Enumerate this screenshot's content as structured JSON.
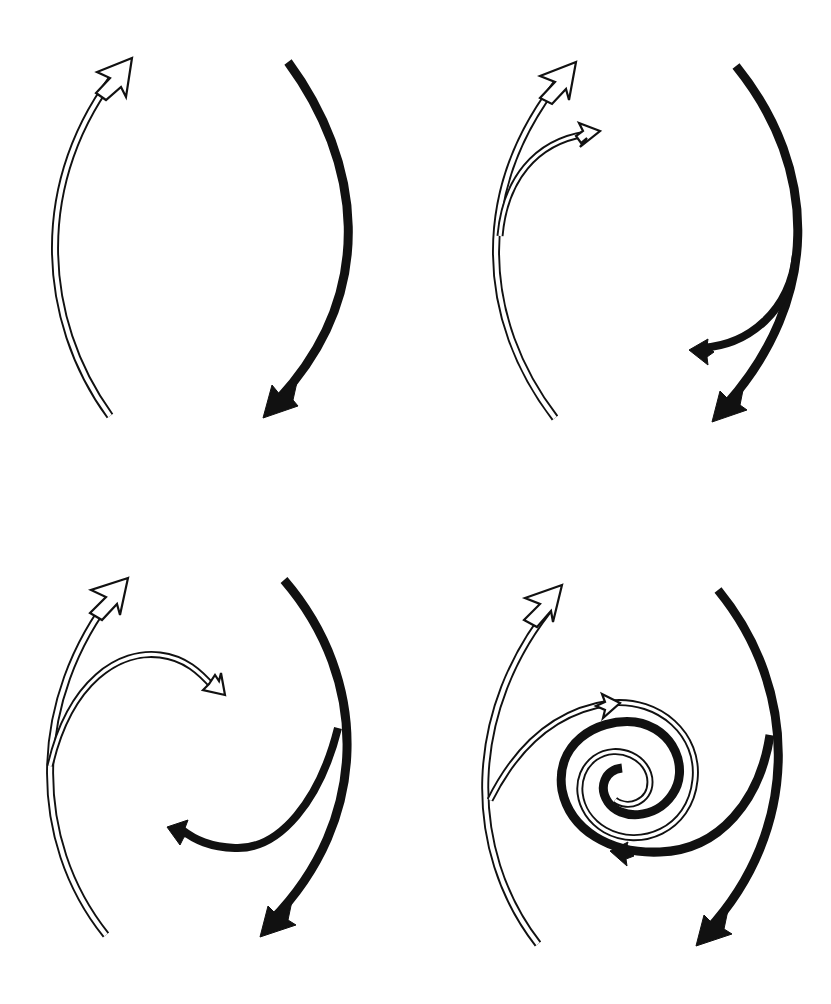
{
  "diagram": {
    "kind": "vortex-formation-sequence",
    "layout": "2x2 panels",
    "colors": {
      "ink": "#111111",
      "background": "#ffffff"
    },
    "hollow_style": {
      "outer_width": 8,
      "inner_width": 4.2
    },
    "solid_width": 9,
    "panels": [
      {
        "id": "panel-1",
        "description": "Two opposing currents: hollow arrow flowing up (left), solid arrow flowing down (right)",
        "hollow_paths": [
          {
            "name": "main-upflow",
            "d": "M110,416 C40,320 30,180 120,68",
            "width": 8
          }
        ],
        "hollow_heads": [
          {
            "name": "main-upflow-head",
            "points": "132,58 97,72 110,78 96,93 106,100 121,87 126,97"
          }
        ],
        "solid_paths": [
          {
            "name": "main-downflow",
            "d": "M288,62 C360,160 380,290 278,400",
            "width": 9
          }
        ],
        "solid_heads": [
          {
            "name": "main-downflow-head",
            "points": "263,418 272,385 281,396 299,373 293,400 298,406"
          }
        ]
      },
      {
        "id": "panel-2",
        "description": "Currents begin to branch: a small hollow branch peels right, a small solid branch peels left",
        "hollow_paths": [
          {
            "name": "main-upflow",
            "d": "M555,418 C480,320 470,190 563,75",
            "width": 8
          },
          {
            "name": "upflow-branch",
            "d": "M500,236 C505,180 535,142 586,134",
            "width": 7
          }
        ],
        "hollow_heads": [
          {
            "name": "main-upflow-head",
            "points": "576,62 540,76 555,82 540,98 552,104 566,89 569,100"
          },
          {
            "name": "upflow-branch-head",
            "points": "600,131 579,123 583,131 576,136 581,143 587,138 580,147"
          }
        ],
        "solid_paths": [
          {
            "name": "main-downflow",
            "d": "M736,66 C820,170 820,300 726,405",
            "width": 9
          },
          {
            "name": "downflow-branch",
            "d": "M796,255 C790,310 750,345 702,348",
            "width": 8
          }
        ],
        "solid_heads": [
          {
            "name": "main-downflow-head",
            "points": "712,422 720,391 729,400 745,380 740,405 747,410"
          },
          {
            "name": "downflow-branch-head",
            "points": "689,350 708,339 707,346 714,352 707,357 708,365"
          }
        ]
      },
      {
        "id": "panel-3",
        "description": "Branches extend inward toward the center, curling around each other",
        "hollow_paths": [
          {
            "name": "main-upflow",
            "d": "M106,935 C30,840 30,700 115,592",
            "width": 8
          },
          {
            "name": "upflow-branch",
            "d": "M50,766 C70,680 120,650 160,655 C185,658 200,672 214,688",
            "width": 7
          }
        ],
        "hollow_heads": [
          {
            "name": "main-upflow-head",
            "points": "128,578 91,590 106,597 90,613 102,620 117,604 120,615"
          },
          {
            "name": "upflow-branch-head",
            "points": "225,695 203,690 209,684 215,675 219,681 221,673"
          }
        ],
        "solid_paths": [
          {
            "name": "main-downflow",
            "d": "M284,580 C370,680 370,820 272,920",
            "width": 9
          },
          {
            "name": "downflow-branch",
            "d": "M338,728 C320,800 280,850 235,848 C210,847 195,840 182,830",
            "width": 8
          }
        ],
        "solid_heads": [
          {
            "name": "main-downflow-head",
            "points": "260,937 268,906 277,915 293,896 288,920 296,925"
          },
          {
            "name": "downflow-branch-head",
            "points": "167,827 188,820 185,828 192,835 184,837 180,845"
          }
        ]
      },
      {
        "id": "panel-4",
        "description": "Branches wind into an interleaved double spiral (vortex) at the center",
        "hollow_paths": [
          {
            "name": "main-upflow",
            "d": "M538,944 C465,850 465,710 555,602",
            "width": 8
          },
          {
            "name": "upflow-branch-spiral",
            "d": "M490,800 C520,740 560,710 610,703 C660,698 700,735 695,780 C690,830 640,850 605,830 C575,812 572,775 595,758 C618,742 650,758 650,782 C650,802 628,810 615,800",
            "width": 7
          }
        ],
        "hollow_heads": [
          {
            "name": "main-upflow-head",
            "points": "562,585 525,598 540,604 524,620 537,627 551,611 553,622"
          },
          {
            "name": "upflow-branch-mid-head",
            "points": "620,703 602,694 605,702 596,706 605,710 603,718"
          }
        ],
        "solid_paths": [
          {
            "name": "main-downflow",
            "d": "M718,590 C800,690 800,830 708,930",
            "width": 9
          },
          {
            "name": "downflow-branch-spiral",
            "d": "M770,735 C760,800 720,850 660,852 C610,854 570,830 562,790 C555,745 595,718 635,722 C675,728 690,770 672,795 C655,820 620,820 608,802 C598,787 605,770 622,768",
            "width": 9
          }
        ],
        "solid_heads": [
          {
            "name": "main-downflow-head",
            "points": "696,946 704,915 713,924 729,905 724,929 732,934"
          },
          {
            "name": "downflow-branch-mid-head",
            "points": "610,851 628,842 626,849 634,856 626,859 627,866"
          }
        ]
      }
    ]
  }
}
